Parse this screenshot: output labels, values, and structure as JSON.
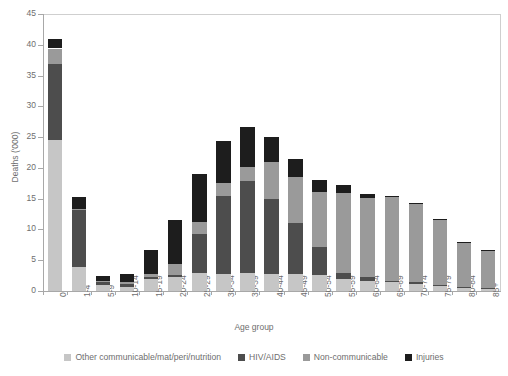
{
  "chart_data": {
    "type": "bar",
    "subtype": "stacked-bar",
    "title": "",
    "xlabel": "Age group",
    "ylabel": "Deaths ('000)",
    "ylim": [
      0,
      45
    ],
    "yticks": [
      0,
      5,
      10,
      15,
      20,
      25,
      30,
      35,
      40,
      45
    ],
    "grid": false,
    "legend_position": "bottom",
    "categories": [
      "0",
      "1-4",
      "5-9",
      "10-14",
      "15-19",
      "20-24",
      "25-29",
      "30-34",
      "35-39",
      "40-44",
      "45-49",
      "50-54",
      "55-59",
      "60-64",
      "65-69",
      "70-74",
      "75-79",
      "80-84",
      "85+"
    ],
    "series": [
      {
        "name": "Other communicable/mat/peri/nutrition",
        "color": "#c6c6c6",
        "values": [
          24.5,
          3.9,
          0.9,
          0.7,
          2.0,
          2.2,
          3.0,
          2.8,
          2.9,
          2.8,
          2.8,
          2.6,
          1.9,
          1.6,
          1.4,
          1.2,
          0.9,
          0.5,
          0.4
        ]
      },
      {
        "name": "HIV/AIDS",
        "color": "#4d4d4d",
        "values": [
          12.4,
          9.2,
          0.5,
          0.5,
          0.3,
          0.4,
          6.3,
          12.7,
          14.9,
          12.2,
          8.2,
          4.5,
          1.0,
          0.7,
          0.3,
          0.2,
          0.1,
          0.1,
          0.1
        ]
      },
      {
        "name": "Non-communicable",
        "color": "#9a9a9a",
        "values": [
          2.5,
          0.3,
          0.3,
          0.3,
          0.4,
          1.8,
          1.9,
          2.0,
          2.4,
          6.0,
          7.6,
          9.0,
          13.1,
          12.8,
          13.5,
          12.7,
          10.6,
          7.3,
          6.0
        ]
      },
      {
        "name": "Injuries",
        "color": "#1d1d1d",
        "values": [
          1.6,
          1.9,
          0.8,
          1.3,
          4.0,
          7.2,
          7.8,
          6.9,
          6.5,
          4.0,
          2.9,
          1.9,
          1.2,
          0.6,
          0.3,
          0.2,
          0.1,
          0.1,
          0.1
        ]
      }
    ],
    "totals": [
      41.0,
      15.3,
      2.5,
      2.8,
      6.7,
      11.6,
      19.0,
      24.4,
      26.7,
      25.0,
      21.5,
      18.0,
      17.2,
      15.7,
      15.5,
      14.3,
      11.7,
      8.0,
      6.6
    ]
  },
  "axes": {
    "y_title": "Deaths ('000)",
    "x_title": "Age group",
    "y_tick_labels": [
      "0",
      "5",
      "10",
      "15",
      "20",
      "25",
      "30",
      "35",
      "40",
      "45"
    ]
  },
  "legend": {
    "items": [
      {
        "label": "Other communicable/mat/peri/nutrition",
        "color": "#c6c6c6"
      },
      {
        "label": "HIV/AIDS",
        "color": "#4d4d4d"
      },
      {
        "label": "Non-communicable",
        "color": "#9a9a9a"
      },
      {
        "label": "Injuries",
        "color": "#1d1d1d"
      }
    ]
  },
  "header": {
    "clipped_title": ""
  }
}
